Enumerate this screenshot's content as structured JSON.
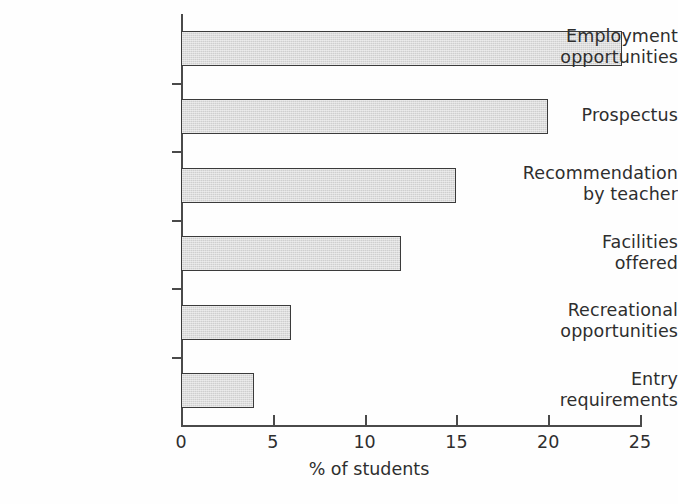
{
  "chart_data": {
    "type": "bar",
    "orientation": "horizontal",
    "title": "",
    "subtitle": "",
    "xlabel": "% of students",
    "ylabel": "",
    "xlim": [
      0,
      25
    ],
    "xticks": [
      0,
      5,
      10,
      15,
      20,
      25
    ],
    "xtick_labels": [
      "0",
      "5",
      "10",
      "15",
      "20",
      "25"
    ],
    "grid": false,
    "legend": null,
    "categories": [
      "Employment\nopportunities",
      "Prospectus",
      "Recommendation\nby teacher",
      "Facilities\noffered",
      "Recreational\nopportunities",
      "Entry\nrequirements"
    ],
    "values": [
      24,
      20,
      15,
      12,
      6,
      4
    ],
    "bar_fill_color": "#cfcfcf",
    "bar_border_color": "#3b3b3b",
    "axis_color": "#4a4a4a",
    "background_color": "#fefefe"
  }
}
